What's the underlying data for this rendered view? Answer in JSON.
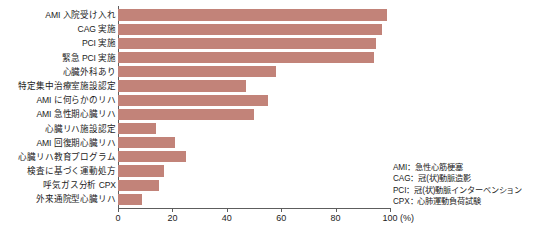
{
  "chart_data": {
    "type": "bar",
    "orientation": "horizontal",
    "title": "",
    "xlabel": "(%)",
    "ylabel": "",
    "xlim": [
      0,
      100
    ],
    "xticks": [
      0,
      20,
      40,
      60,
      80,
      100
    ],
    "xtick_labels": [
      "0",
      "20",
      "40",
      "60",
      "80",
      "100"
    ],
    "grid": false,
    "legend_position": "bottom-right",
    "bar_color": "#c28379",
    "axis_color": "#5d5d5d",
    "categories": [
      "AMI 入院受け入れ",
      "CAG 実施",
      "PCI 実施",
      "緊急 PCI 実施",
      "心臓外科あり",
      "特定集中治療室施設認定",
      "AMI に何らかのリハ",
      "AMI 急性期心臓リハ",
      "心臓リハ施設認定",
      "AMI 回復期心臓リハ",
      "心臓リハ教育プログラム",
      "検査に基づく運動処方",
      "呼気ガス分析 CPX",
      "外来通院型心臓リハ"
    ],
    "values": [
      99,
      97,
      95,
      94,
      58,
      47,
      55,
      50,
      14,
      21,
      25,
      17,
      15,
      9
    ]
  },
  "axis": {
    "unit_label": "(%)"
  },
  "legend": {
    "lines": [
      "AMI：急性心筋梗塞",
      "CAG：冠(状)動脈造影",
      "PCI：冠(状)動脈インターベンション",
      "CPX：心肺運動負荷試験"
    ]
  }
}
